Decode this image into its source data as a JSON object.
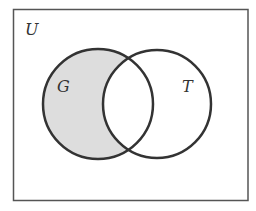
{
  "diagram": {
    "type": "venn",
    "universe_label": "U",
    "sets": [
      {
        "label": "G",
        "shaded": "only"
      },
      {
        "label": "T",
        "shaded": "none"
      }
    ],
    "shaded_region": "G minus T",
    "colors": {
      "outline": "#333333",
      "shade": "#dddddd",
      "frame": "#555555",
      "background": "#ffffff"
    }
  }
}
